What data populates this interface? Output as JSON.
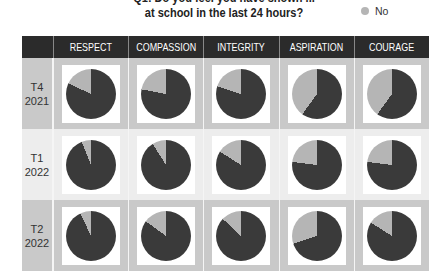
{
  "title": {
    "line1": "Q1: Do you feel you have shown ...",
    "line2": "at school in the last 24 hours?"
  },
  "legend": {
    "items": [
      {
        "label": "No",
        "color": "#b5b5b5"
      }
    ]
  },
  "colors": {
    "yes": "#3a3a3a",
    "no": "#b5b5b5"
  },
  "table": {
    "columns": [
      "",
      "RESPECT",
      "COMPASSION",
      "INTEGRITY",
      "ASPIRATION",
      "COURAGE"
    ],
    "rows": [
      {
        "term": "T4",
        "year": "2021"
      },
      {
        "term": "T1",
        "year": "2022"
      },
      {
        "term": "T2",
        "year": "2022"
      }
    ]
  },
  "chart_data": {
    "type": "pie",
    "title": "... at school in the last 24 hours?",
    "legend": [
      "No"
    ],
    "legend_position": "top-right",
    "categories": [
      "RESPECT",
      "COMPASSION",
      "INTEGRITY",
      "ASPIRATION",
      "COURAGE"
    ],
    "periods": [
      "T4 2021",
      "T1 2022",
      "T2 2022"
    ],
    "series": [
      {
        "name": "T4 2021",
        "no_percent": [
          18,
          22,
          20,
          40,
          40
        ]
      },
      {
        "name": "T1 2022",
        "no_percent": [
          6,
          9,
          16,
          23,
          23
        ]
      },
      {
        "name": "T2 2022",
        "no_percent": [
          7,
          15,
          13,
          30,
          16
        ]
      }
    ],
    "note": "Dark slice = remaining (Yes); light gray slice = No, estimated from pie angles"
  }
}
